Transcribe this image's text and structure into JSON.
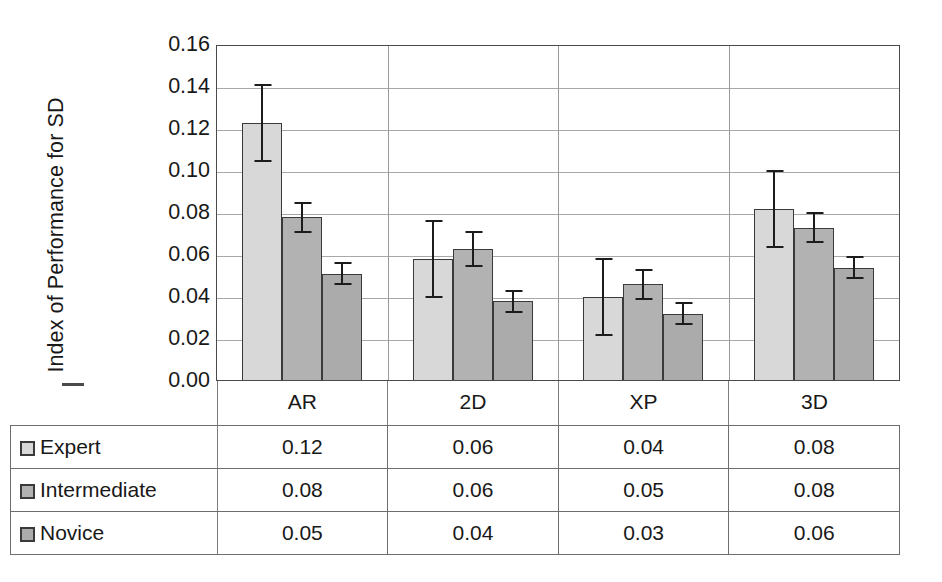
{
  "chart_data": {
    "type": "bar",
    "title": "",
    "subtitle": "",
    "xlabel": "",
    "ylabel": "Index of Performance for SD",
    "categories": [
      "AR",
      "2D",
      "XP",
      "3D"
    ],
    "ylim": [
      0.0,
      0.16
    ],
    "ytick_step": 0.02,
    "ytick_labels": [
      "0.16",
      "0.14",
      "0.12",
      "0.10",
      "0.08",
      "0.06",
      "0.04",
      "0.02",
      "0.00"
    ],
    "ytick_values": [
      0.16,
      0.14,
      0.12,
      0.1,
      0.08,
      0.06,
      0.04,
      0.02,
      0.0
    ],
    "grid": true,
    "legend_position": "data-table",
    "error_bars": "symmetric",
    "series": [
      {
        "name": "Expert",
        "color": "#d8d8d8",
        "values": [
          0.123,
          0.058,
          0.04,
          0.082
        ],
        "errors": [
          0.018,
          0.018,
          0.018,
          0.018
        ],
        "table_values": [
          "0.12",
          "0.06",
          "0.04",
          "0.08"
        ]
      },
      {
        "name": "Intermediate",
        "color": "#b2b2b2",
        "values": [
          0.078,
          0.063,
          0.046,
          0.073
        ],
        "errors": [
          0.007,
          0.008,
          0.007,
          0.007
        ],
        "table_values": [
          "0.08",
          "0.06",
          "0.05",
          "0.08"
        ]
      },
      {
        "name": "Novice",
        "color": "#ababab",
        "values": [
          0.051,
          0.038,
          0.032,
          0.054
        ],
        "errors": [
          0.005,
          0.005,
          0.005,
          0.005
        ],
        "table_values": [
          "0.05",
          "0.04",
          "0.03",
          "0.06"
        ]
      }
    ]
  },
  "data_table": {
    "corner_label": "",
    "column_headers": [
      "AR",
      "2D",
      "XP",
      "3D"
    ],
    "rows": [
      {
        "label": "Expert",
        "swatch": "#d8d8d8",
        "values": [
          "0.12",
          "0.06",
          "0.04",
          "0.08"
        ]
      },
      {
        "label": "Intermediate",
        "swatch": "#b2b2b2",
        "values": [
          "0.08",
          "0.06",
          "0.05",
          "0.08"
        ]
      },
      {
        "label": "Novice",
        "swatch": "#ababab",
        "values": [
          "0.05",
          "0.04",
          "0.03",
          "0.06"
        ]
      }
    ]
  },
  "colors": {
    "axis": "#4a4a4a",
    "grid": "#a8a8a8",
    "bar_outline": "#3a3a3a",
    "error_bar": "#1c1c1c",
    "text": "#181818"
  }
}
